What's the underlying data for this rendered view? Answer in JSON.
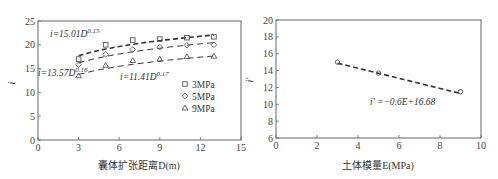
{
  "chart_data": [
    {
      "type": "scatter",
      "title": "",
      "xlabel": "囊体扩张距离D(m)",
      "ylabel": "i",
      "xlim": [
        0,
        15
      ],
      "ylim": [
        0,
        25
      ],
      "xticks": [
        0,
        3,
        6,
        9,
        12,
        15
      ],
      "yticks": [
        0,
        5,
        10,
        15,
        20,
        25
      ],
      "grid": false,
      "legend_position": "right-middle",
      "x": [
        3,
        5,
        7,
        9,
        11,
        13
      ],
      "series": [
        {
          "name": "3MPa",
          "marker": "square",
          "values": [
            17.0,
            20.0,
            21.0,
            21.2,
            21.5,
            21.7
          ],
          "fit": "i=15.01D^0.15",
          "fit_a": 15.01,
          "fit_b": 0.15
        },
        {
          "name": "5MPa",
          "marker": "diamond",
          "values": [
            15.8,
            18.0,
            19.0,
            19.5,
            19.9,
            20.0
          ],
          "fit": "i=13.57D^0.16",
          "fit_a": 13.57,
          "fit_b": 0.16
        },
        {
          "name": "9MPa",
          "marker": "triangle",
          "values": [
            13.5,
            15.7,
            16.7,
            17.0,
            17.5,
            17.6
          ],
          "fit": "i=11.41D^0.17",
          "fit_a": 11.41,
          "fit_b": 0.17
        }
      ],
      "annotations": [
        {
          "text": "i=15.01D",
          "sup": "0.15"
        },
        {
          "text": "i=13.57D",
          "sup": "0.16"
        },
        {
          "text": "i=11.41D",
          "sup": "0.17"
        }
      ]
    },
    {
      "type": "scatter",
      "title": "",
      "xlabel": "土体模量E(MPa)",
      "ylabel": "i'",
      "xlim": [
        0,
        10
      ],
      "ylim": [
        6,
        20
      ],
      "xticks": [
        0,
        2,
        4,
        6,
        8,
        10
      ],
      "yticks": [
        6,
        8,
        10,
        12,
        14,
        16,
        18,
        20
      ],
      "grid": false,
      "x": [
        3,
        5,
        9
      ],
      "series": [
        {
          "name": "i'",
          "marker": "circle",
          "values": [
            15.0,
            13.7,
            11.5
          ],
          "fit": "i'=-0.6E+16.68",
          "fit_slope": -0.6,
          "fit_intercept": 16.68
        }
      ],
      "annotations": [
        {
          "text": "i' =−0.6E+16.68"
        }
      ]
    }
  ],
  "left": {
    "xlabel": "囊体扩张距离D(m)",
    "ylabel": "i",
    "eq1": "i=15.01D",
    "eq1_sup": "0.15",
    "eq2": "i=13.57D",
    "eq2_sup": "0.16",
    "eq3": "i=11.41D",
    "eq3_sup": "0.17",
    "legend": [
      "3MPa",
      "5MPa",
      "9MPa"
    ]
  },
  "right": {
    "xlabel": "土体模量E(MPa)",
    "ylabel": "i'",
    "eq": "i' =−0.6E+16.68"
  },
  "colors": {
    "axis": "#555555",
    "line": "#333333",
    "marker": "#555555"
  }
}
